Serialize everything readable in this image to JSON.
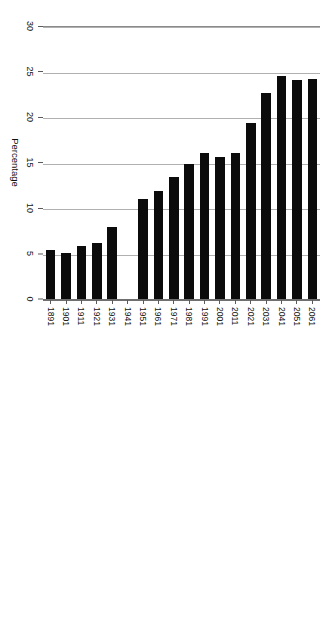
{
  "chart_data": {
    "type": "bar",
    "orientation": "horizontal",
    "title": "",
    "xlabel": "Percentage",
    "ylabel": "",
    "xlim": [
      0,
      30
    ],
    "xticks": [
      0,
      5,
      10,
      15,
      20,
      25,
      30
    ],
    "grid": true,
    "legend": null,
    "bar_color": "#0b0b0b",
    "categories": [
      "2061",
      "2051",
      "2041",
      "2031",
      "2021",
      "2011",
      "2001",
      "1991",
      "1981",
      "1971",
      "1961",
      "1951",
      "1941",
      "1931",
      "1921",
      "1911",
      "1901",
      "1891"
    ],
    "values": [
      24.3,
      24.2,
      24.6,
      22.7,
      19.4,
      16.2,
      15.7,
      16.2,
      14.9,
      13.5,
      12.0,
      11.1,
      0,
      8.0,
      6.3,
      5.9,
      5.2,
      5.5
    ]
  },
  "axes": {
    "value_axis_title": "Percentage",
    "value_tick_labels": [
      "0",
      "5",
      "10",
      "15",
      "20",
      "25",
      "30"
    ],
    "category_tick_labels": [
      "2061",
      "2051",
      "2041",
      "2031",
      "2021",
      "2011",
      "2001",
      "1991",
      "1981",
      "1971",
      "1961",
      "1951",
      "1941",
      "1931",
      "1921",
      "1911",
      "1901",
      "1891"
    ]
  }
}
